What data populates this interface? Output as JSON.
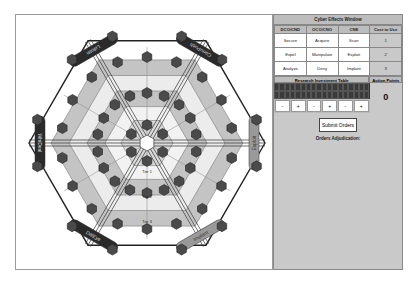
{
  "panel": {
    "title": "Cyber Effects Window",
    "columns": [
      "DCO/CND",
      "OCO/CNO",
      "CNE",
      "Cost to Use"
    ],
    "rows": [
      [
        "Secure",
        "Acquire",
        "Scan",
        "1"
      ],
      [
        "Expel",
        "Manipulate",
        "Exploit",
        "2"
      ],
      [
        "Analyze",
        "Deny",
        "Implant",
        "3"
      ]
    ],
    "research_table_title": "Research Investment Table",
    "action_points_label": "Action Points",
    "action_points_value": "0",
    "investment_buttons": [
      "-",
      "+",
      "-",
      "+",
      "-",
      "+"
    ],
    "submit_label": "Submit Orders",
    "adjudication_label": "Orders Adjudication:"
  },
  "board": {
    "edge_labels": [
      "CorruPush",
      "Exploit",
      "Implant",
      "DelEye",
      "WhiDeal",
      "Lofotin"
    ],
    "tier_labels": [
      "Tier 1",
      "Tier 2",
      "Tier 3"
    ],
    "colors": {
      "outline": "#222222",
      "ring_outer": "#ffffff",
      "ring_mid": "#c4c4c4",
      "ring_inner": "#d9d9d9",
      "node": "#4a4a4a",
      "label_dark": "#2a2a2a",
      "label_light": "#9a9a9a"
    }
  }
}
